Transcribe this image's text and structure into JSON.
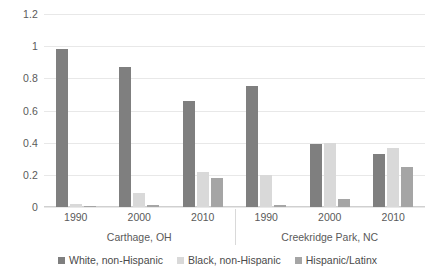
{
  "chart_data": {
    "type": "bar",
    "title": "",
    "subtitle": "",
    "xlabel": "",
    "ylabel": "",
    "ylim": [
      0,
      1.2
    ],
    "yticks": [
      0,
      0.2,
      0.4,
      0.6,
      0.8,
      1,
      1.2
    ],
    "ytick_labels": [
      "0",
      "0.2",
      "0.4",
      "0.6",
      "0.8",
      "1",
      "1.2"
    ],
    "grid": true,
    "legend_position": "bottom",
    "group_labels": [
      "Carthage, OH",
      "Creekridge Park, NC"
    ],
    "categories": [
      "1990",
      "2000",
      "2010",
      "1990",
      "2000",
      "2010"
    ],
    "series": [
      {
        "name": "White, non-Hispanic",
        "color": "#7f7f7f",
        "values": [
          0.98,
          0.87,
          0.66,
          0.75,
          0.39,
          0.33
        ]
      },
      {
        "name": "Black, non-Hispanic",
        "color": "#d9d9d9",
        "values": [
          0.02,
          0.09,
          0.22,
          0.2,
          0.4,
          0.37
        ]
      },
      {
        "name": "Hispanic/Latinx",
        "color": "#a5a5a5",
        "values": [
          0.005,
          0.01,
          0.18,
          0.01,
          0.05,
          0.25
        ]
      }
    ],
    "clusters": [
      {
        "label": "Carthage, OH",
        "groups": [
          {
            "label": "1990",
            "bars": [
              0.98,
              0.02,
              0.005
            ]
          },
          {
            "label": "2000",
            "bars": [
              0.87,
              0.09,
              0.01
            ]
          },
          {
            "label": "2010",
            "bars": [
              0.66,
              0.22,
              0.18
            ]
          }
        ]
      },
      {
        "label": "Creekridge Park, NC",
        "groups": [
          {
            "label": "1990",
            "bars": [
              0.75,
              0.2,
              0.01
            ]
          },
          {
            "label": "2000",
            "bars": [
              0.39,
              0.4,
              0.05
            ]
          },
          {
            "label": "2010",
            "bars": [
              0.33,
              0.37,
              0.25
            ]
          }
        ]
      }
    ]
  },
  "axis": {
    "y_ticks": [
      {
        "value": 1.2,
        "label": "1.2"
      },
      {
        "value": 1.0,
        "label": "1"
      },
      {
        "value": 0.8,
        "label": "0.8"
      },
      {
        "value": 0.6,
        "label": "0.6"
      },
      {
        "value": 0.4,
        "label": "0.4"
      },
      {
        "value": 0.2,
        "label": "0.2"
      },
      {
        "value": 0.0,
        "label": "0"
      }
    ]
  },
  "legend": {
    "items": [
      {
        "label": "White, non-Hispanic",
        "color": "#7f7f7f"
      },
      {
        "label": "Black, non-Hispanic",
        "color": "#d9d9d9"
      },
      {
        "label": "Hispanic/Latinx",
        "color": "#a5a5a5"
      }
    ]
  }
}
